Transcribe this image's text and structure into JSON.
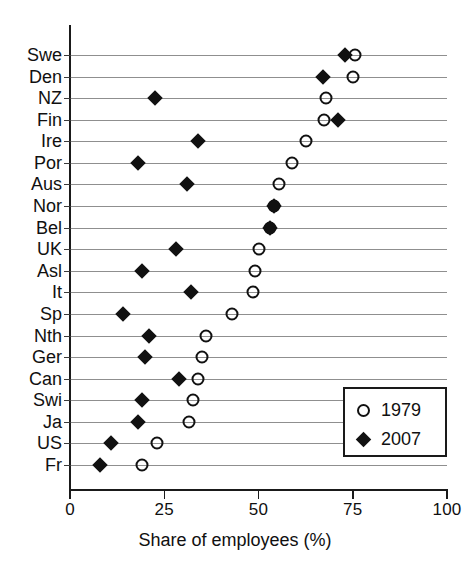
{
  "chart_data": {
    "type": "scatter",
    "title": "",
    "xlabel": "Share of employees (%)",
    "ylabel": "",
    "xlim": [
      0,
      100
    ],
    "xticks": [
      0,
      25,
      50,
      75,
      100
    ],
    "xtick_labels": [
      "0",
      "25",
      "50",
      "75",
      "100"
    ],
    "grid": true,
    "legend_position": "bottom-right",
    "categories": [
      "Swe",
      "Den",
      "NZ",
      "Fin",
      "Ire",
      "Por",
      "Aus",
      "Nor",
      "Bel",
      "UK",
      "Asl",
      "It",
      "Sp",
      "Nth",
      "Ger",
      "Can",
      "Swi",
      "Ja",
      "US",
      "Fr"
    ],
    "series": [
      {
        "name": "1979",
        "marker": "open-circle",
        "color": "#111111",
        "values": [
          75.5,
          75,
          68,
          67.5,
          62.5,
          59,
          55.5,
          54,
          53,
          50,
          49,
          48.5,
          43,
          36,
          35,
          34,
          32.5,
          31.5,
          23,
          19
        ]
      },
      {
        "name": "2007",
        "marker": "filled-diamond",
        "color": "#111111",
        "values": [
          73,
          67,
          22.5,
          71,
          34,
          18,
          31,
          54,
          53,
          28,
          19,
          32,
          14,
          21,
          20,
          29,
          19,
          18,
          11,
          8
        ]
      }
    ]
  },
  "legend": {
    "items": [
      {
        "label": "1979",
        "marker": "open-circle"
      },
      {
        "label": "2007",
        "marker": "filled-diamond"
      }
    ]
  }
}
